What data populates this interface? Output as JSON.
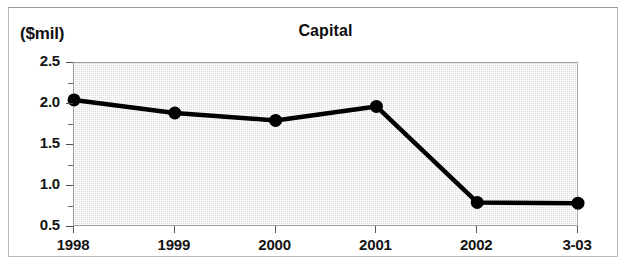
{
  "figure": {
    "unit_label": "($mil)",
    "title": "Capital"
  },
  "chart_data": {
    "type": "line",
    "title": "Capital",
    "subtitle": "",
    "xlabel": "",
    "ylabel": "($mil)",
    "unit": "$mil",
    "categories": [
      "1998",
      "1999",
      "2000",
      "2001",
      "2002",
      "3-03"
    ],
    "values": [
      2.05,
      1.89,
      1.8,
      1.97,
      0.8,
      0.79
    ],
    "series": [
      {
        "name": "Capital",
        "values": [
          2.05,
          1.89,
          1.8,
          1.97,
          0.8,
          0.79
        ]
      }
    ],
    "ylim": [
      0.5,
      2.5
    ],
    "ytick_labels": [
      "2.5",
      "2.0",
      "1.5",
      "1.0",
      "0.5"
    ],
    "ytick_values": [
      2.5,
      2.0,
      1.5,
      1.0,
      0.5
    ],
    "yminor_values": [
      2.25,
      1.75,
      1.25,
      0.75
    ],
    "xtick_labels": [
      "1998",
      "1999",
      "2000",
      "2001",
      "2002",
      "3-03"
    ],
    "grid": false,
    "legend": "none",
    "line_color": "#000000",
    "marker": "circle",
    "marker_color": "#000000",
    "plot_background": "#e4e4e4"
  }
}
